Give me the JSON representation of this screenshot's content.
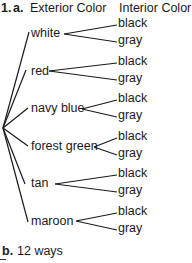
{
  "header": {
    "number": "1.",
    "part_a": "a.",
    "col1": "Exterior Color",
    "col2": "Interior Color"
  },
  "tree": {
    "exterior": [
      {
        "label": "white",
        "x": 31,
        "y": 33,
        "interior": [
          "black",
          "gray"
        ]
      },
      {
        "label": "red",
        "x": 31,
        "y": 71,
        "interior": [
          "black",
          "gray"
        ]
      },
      {
        "label": "navy blue",
        "x": 31,
        "y": 108,
        "interior": [
          "black",
          "gray"
        ]
      },
      {
        "label": "forest green",
        "x": 31,
        "y": 146,
        "interior": [
          "black",
          "gray"
        ]
      },
      {
        "label": "tan",
        "x": 31,
        "y": 183,
        "interior": [
          "black",
          "gray"
        ]
      },
      {
        "label": "maroon",
        "x": 31,
        "y": 221,
        "interior": [
          "black",
          "gray"
        ]
      }
    ]
  },
  "answer_b": {
    "label": "b.",
    "text": "12 ways"
  }
}
